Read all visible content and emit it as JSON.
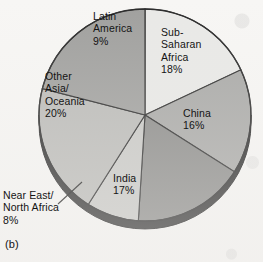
{
  "figure": {
    "caption": "(b)",
    "background_color": "#f7f6f4"
  },
  "chart_data": {
    "type": "pie",
    "title": "",
    "start_angle_deg": 0,
    "direction": "clockwise",
    "legend": "none",
    "labels_position": "inside-slices, with Near East/North Africa outside with leader line",
    "categories": [
      "Sub-Saharan Africa",
      "China",
      "India",
      "Near East/North Africa",
      "Other Asia/Oceania",
      "Latin America"
    ],
    "values": [
      18,
      16,
      17,
      8,
      20,
      9
    ],
    "value_unit": "%",
    "slices": [
      {
        "name": "Sub-Saharan Africa",
        "label": "Sub-\nSaharan\nAfrica\n18%",
        "value": 18,
        "value_text": "18%",
        "color": "#e9e9e7",
        "start_deg": 0,
        "end_deg": 64.8
      },
      {
        "name": "China",
        "label": "China\n16%",
        "value": 16,
        "value_text": "16%",
        "color": "#a9a9a7",
        "start_deg": 64.8,
        "end_deg": 122.4
      },
      {
        "name": "India",
        "label": "India\n17%",
        "value": 17,
        "value_text": "17%",
        "color": "#8c8c8a",
        "start_deg": 122.4,
        "end_deg": 183.6
      },
      {
        "name": "Near East/North Africa",
        "label": "Near East/\nNorth Africa\n8%",
        "value": 8,
        "value_text": "8%",
        "color": "#c9c9c6",
        "start_deg": 183.6,
        "end_deg": 212.4
      },
      {
        "name": "Other Asia/Oceania",
        "label": "Other\nAsia/\nOceania\n20%",
        "value": 20,
        "value_text": "20%",
        "color": "#bbbbb8",
        "start_deg": 212.4,
        "end_deg": 284.4
      },
      {
        "name": "Latin America",
        "label": "Latin\nAmerica\n9%",
        "value": 9,
        "value_text": "9%",
        "color": "#a0a09e",
        "start_deg": 284.4,
        "end_deg": 360
      }
    ],
    "style": {
      "three_d": true,
      "depth_color": "#2e2e2e",
      "outline_color": "#2b2b2b",
      "center_x": 145,
      "center_y": 115,
      "radius": 106,
      "depth_px": 8
    }
  }
}
